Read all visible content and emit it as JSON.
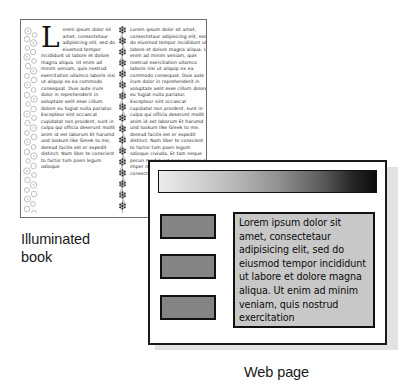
{
  "figure": {
    "caption_book": "Illuminated\nbook",
    "caption_web": "Web page"
  },
  "book_panel": {
    "name": "Illuminated book page",
    "dropcap": "L",
    "left_column_text": "orem ipsum dolor sit amet, consectetaur adipisicing elit, sed do eiusmod tempor incididunt ut labore et dolore magna aliqua. Ut enim ad minim veniam, quis nostrud exercitation ullamco laboris nisi ut aliquip ex ea commodo consequat. Duis aute irure dolor in reprehenderit in voluptate velit esse cillum dolore eu fugiat nulla pariatur. Excepteur sint occaecat cupidatat non proident, sunt in culpa qui officia deserunt mollit anim id est laborum Et harumd und lookum like Greek to me, dereud facilis est er expedit distinct. Nam liber te conscient to factor tum poen legum odioque",
    "right_column_text": "Lorem ipsum dolor sit amet, consectetaur adipisicing elit, sed do eiusmod tempor incididunt ut labore et dolore magna aliqua. Ut enim ad minim veniam, quis nostrud exercitation ullamco laboris nisi ut aliquip ex ea commodo consequat. Duis aute irure dolor in reprehenderit in voluptate velit esse cillum dolore eu fugiat nulla pariatur. Excepteur sint occaecat cupidatat non proident, sunt in culpa qui officia deserunt mollit anim id est laborum Et harumd und lookum like Greek to me, dereud facilis est er expedit distinct. Nam liber te conscient to factor tum poen legum odioque civiuda. Et tam neque pecun modut est neque nonor et imper ned libidig met, consectetur adipiscing",
    "ornaments": {
      "left_rail": "illuminated-circles-border",
      "divider": "illuminated-vine-divider"
    }
  },
  "web_panel": {
    "name": "Web page mockup",
    "banner": {
      "label": "banner-gradient",
      "from": "#ececec",
      "to": "#0d0d0d"
    },
    "nav_boxes": [
      {
        "label": "nav-block-1",
        "color": "#848484"
      },
      {
        "label": "nav-block-2",
        "color": "#848484"
      },
      {
        "label": "nav-block-3",
        "color": "#848484"
      }
    ],
    "content_text": "Lorem ipsum dolor sit amet, consectetaur adipisicing elit, sed do eiusmod tempor incididunt ut labore et dolore magna aliqua. Ut enim ad minim veniam, quis nostrud exercitation",
    "content_bg": "#c8c8c8"
  }
}
